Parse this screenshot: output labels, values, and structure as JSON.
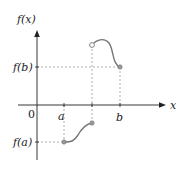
{
  "diagram": {
    "y_axis_label": "f(x)",
    "x_axis_label": "x",
    "origin_label": "0",
    "x_ticks": [
      {
        "label": "a",
        "x": 64
      },
      {
        "label": "",
        "x": 92
      },
      {
        "label": "b",
        "x": 120
      }
    ],
    "y_ticks": [
      {
        "label": "f(b)",
        "y": 67
      },
      {
        "label": "f(a)",
        "y": 142
      }
    ],
    "colors": {
      "axis": "#222222",
      "curve": "#777777",
      "dash": "#999999",
      "point_fill": "#999999"
    },
    "segments": [
      {
        "name": "lower-piece",
        "from": "f(a) closed at a",
        "to": "closed endpoint at jump"
      },
      {
        "name": "upper-piece",
        "from": "open circle at jump",
        "to": "f(b) closed at b"
      }
    ]
  }
}
